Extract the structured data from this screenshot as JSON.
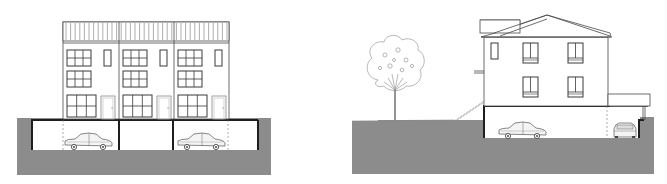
{
  "figure": {
    "type": "architectural-elevation",
    "drawings": [
      {
        "id": "townhouses-front",
        "description": "Front elevation of three attached townhouses over an underground garage",
        "units": 3,
        "floors_above_ground": 3,
        "rooftop_screen": true,
        "windows_per_unit": {
          "upper_grid": 2,
          "ground_wide": 1,
          "narrow_slot": 1
        },
        "doors_per_unit": 1,
        "garage_bays": 4,
        "cars": 2
      },
      {
        "id": "house-side",
        "description": "Side elevation of a two-storey house with hip roof, carport and underground garage",
        "floors_above_ground": 2,
        "windows": 5,
        "tree": true,
        "exterior_stair": true,
        "carport": true,
        "cars": 2
      }
    ],
    "colors": {
      "ground": "#8c8c8c",
      "line": "#4a4a4a",
      "heavy_line": "#1e1e1e",
      "background": "#ffffff"
    }
  }
}
